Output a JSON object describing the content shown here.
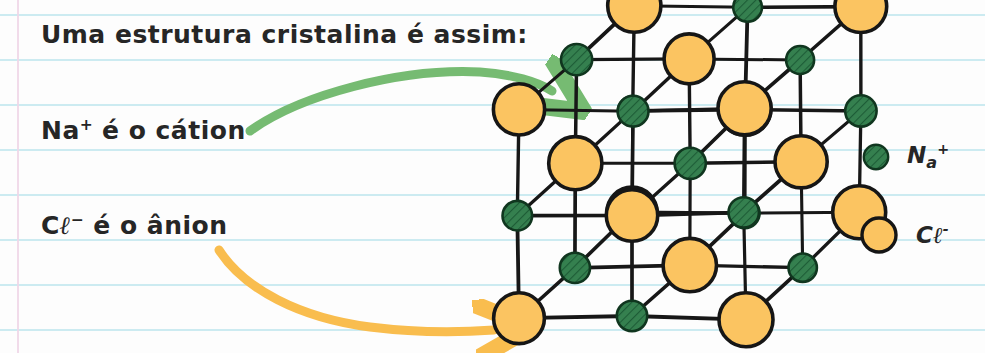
{
  "page": {
    "background_color": "#fdfdfd",
    "rule_color": "#c9eaf0",
    "margin_color": "#f0d7e8",
    "rule_y_positions": [
      14,
      59,
      104,
      149,
      194,
      239,
      284,
      329
    ],
    "margin_x": 17
  },
  "notes": {
    "title": "Uma estrutura cristalina é assim:",
    "cation_line_symbol": "Na",
    "cation_line_charge": "+",
    "cation_line_rest": " é o cátion",
    "anion_line_symbol_c": "C",
    "anion_line_symbol_l": "ℓ",
    "anion_line_charge": "−",
    "anion_line_rest": " é o ânion"
  },
  "arrows": [
    {
      "name": "green-arrow",
      "color": "#76bb72",
      "from_label": "Na+ é o cátion",
      "to_label": "crystal-lattice",
      "start": [
        250,
        130
      ],
      "end": [
        556,
        92
      ]
    },
    {
      "name": "orange-arrow",
      "color": "#f9bd4e",
      "from_label": "Cl− é o ânion",
      "to_label": "crystal-lattice",
      "start": [
        219,
        250
      ],
      "end": [
        500,
        331
      ]
    }
  ],
  "legend": {
    "items": [
      {
        "icon": "sphere-green-hatched",
        "fill": "#35804f",
        "stroke": "#123b23",
        "symbol": "N",
        "sub": "a",
        "charge": "+",
        "label": "Na+"
      },
      {
        "icon": "sphere-orange",
        "fill": "#fbc461",
        "stroke": "#151515",
        "symbol": "C",
        "sub": "ℓ",
        "charge": "-",
        "label": "Cl-"
      }
    ]
  },
  "lattice": {
    "name": "nacl-crystal-lattice",
    "description": "Rock-salt cubic lattice, 3x3x3 oblique projection",
    "ion_colors": {
      "chloride_fill": "#fbc461",
      "chloride_stroke": "#161616",
      "sodium_fill": "#35804f",
      "sodium_stroke": "#10361f",
      "bond_stroke": "#171717"
    },
    "radii": {
      "chloride": 26,
      "sodium": 15
    },
    "grid": {
      "origin": [
        519,
        318
      ],
      "step_x": 113,
      "step_y": -104,
      "depth_x": 57,
      "depth_y": -52,
      "counts": [
        3,
        3,
        3
      ]
    }
  }
}
